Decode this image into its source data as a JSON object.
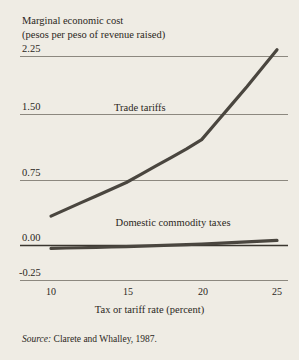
{
  "chart_data": {
    "type": "line",
    "title": "Marginal economic cost",
    "subtitle": "(pesos per peso of revenue raised)",
    "xlabel": "Tax or tariff rate (percent)",
    "ylabel": "Marginal economic cost (pesos per peso of revenue raised)",
    "xlim": [
      10,
      25
    ],
    "ylim": [
      -0.25,
      2.25
    ],
    "grid": true,
    "legend_position": "inline-labels",
    "xticks": [
      10,
      15,
      20,
      25
    ],
    "xticklabels": [
      "10",
      "15",
      "20",
      "25"
    ],
    "yticks": [
      2.25,
      1.5,
      0.75,
      0,
      -0.25
    ],
    "yticklabels": [
      "2.25",
      "1.50",
      "0.75",
      "0.00",
      "-0.25"
    ],
    "x": [
      10,
      11,
      12,
      13,
      14,
      15,
      16,
      17,
      18,
      19,
      20,
      21,
      22,
      23,
      24,
      25
    ],
    "series": [
      {
        "name": "Trade tariffs",
        "values": [
          0.35,
          0.43,
          0.51,
          0.59,
          0.67,
          0.75,
          0.85,
          0.95,
          1.05,
          1.15,
          1.26,
          1.47,
          1.68,
          1.89,
          2.11,
          2.33
        ],
        "color": "#4a463f",
        "label_x": 15.9,
        "label_y": 1.62
      },
      {
        "name": "Domestic commodity taxes",
        "values": [
          -0.035,
          -0.03,
          -0.027,
          -0.023,
          -0.018,
          -0.013,
          -0.008,
          -0.002,
          0.004,
          0.011,
          0.018,
          0.026,
          0.034,
          0.042,
          0.051,
          0.06
        ],
        "color": "#4a463f",
        "label_x": 18.1,
        "label_y": 0.26
      }
    ],
    "source": {
      "label": "Source:",
      "text": "Clarete and Whalley, 1987."
    },
    "colors": {
      "background": "#efece4",
      "gridline": "#8c887f",
      "axis_text": "#2b2722",
      "series_line": "#4a463f"
    }
  }
}
